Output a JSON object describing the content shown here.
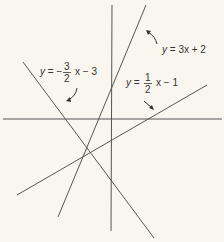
{
  "diagram": {
    "colors": {
      "background": "#f8f6ee",
      "line": "#555555",
      "text": "#333333"
    },
    "axes": {
      "x_axis": {
        "x1": 3,
        "y1": 119,
        "x2": 222,
        "y2": 119
      },
      "y_axis": {
        "x1": 112,
        "y1": 5,
        "x2": 111,
        "y2": 231
      }
    },
    "lines": [
      {
        "id": "line-3x-plus-2",
        "equation": "y = 3x + 2",
        "x1": 146,
        "y1": 5,
        "x2": 58,
        "y2": 217
      },
      {
        "id": "line-neg-3-2-x-minus-3",
        "equation": "y = -3/2 x - 3",
        "x1": 23,
        "y1": 62,
        "x2": 154,
        "y2": 238
      },
      {
        "id": "line-1-2-x-minus-1",
        "equation": "y = 1/2 x - 1",
        "x1": 17,
        "y1": 195,
        "x2": 207,
        "y2": 85
      }
    ],
    "labels": {
      "l1": {
        "y": "y",
        "eq": "= 3x + 2"
      },
      "l2": {
        "y": "y",
        "eq": "= −",
        "num": "3",
        "den": "2",
        "rest": "x − 3"
      },
      "l3": {
        "y": "y",
        "eq": "=",
        "num": "1",
        "den": "2",
        "rest": "x − 1"
      }
    }
  }
}
